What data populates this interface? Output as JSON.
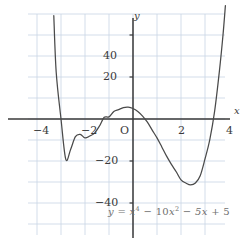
{
  "chart_data": {
    "type": "line",
    "title": "",
    "subtitle": "",
    "equation_text": "y = x⁴ − 10x² − 5x + 5",
    "equation_parts": {
      "lhs": "y",
      "equals": "=",
      "t1_base": "x",
      "t1_exp": "4",
      "op1": "−",
      "t2_coef": "10",
      "t2_base": "x",
      "t2_exp": "2",
      "op2": "−",
      "t3": "5x",
      "op3": "+",
      "t4": "5"
    },
    "function": "x**4 - 10*x**2 - 5*x + 5",
    "xlabel": "x",
    "ylabel": "y",
    "origin_label": "O",
    "xlim": [
      -4.4,
      3.85
    ],
    "ylim": [
      -50,
      55
    ],
    "x_ticks": [
      -4,
      -2,
      2,
      4
    ],
    "x_tick_labels": [
      "−4",
      "−2",
      "2",
      "4"
    ],
    "y_ticks": [
      -40,
      -20,
      20,
      40
    ],
    "y_tick_labels": [
      "−40",
      "−20",
      "20",
      "40"
    ],
    "grid": true,
    "grid_x_step": 1,
    "grid_y_step": 10,
    "legend": "none",
    "roots_approx": [
      -2.96,
      -1.34,
      0.54,
      3.75
    ],
    "local_extrema": [
      {
        "kind": "local-min",
        "x": -2.13,
        "y": -7.9
      },
      {
        "kind": "local-max",
        "x": -0.25,
        "y": 5.6
      },
      {
        "kind": "local-min",
        "x": 2.38,
        "y": -31.4
      }
    ],
    "points": [
      {
        "x": -3.3,
        "y": 49.2
      },
      {
        "x": -3.2,
        "y": 22.3
      },
      {
        "x": -3.0,
        "y": 0.0
      },
      {
        "x": -2.8,
        "y": -19.2
      },
      {
        "x": -2.6,
        "y": -14.5
      },
      {
        "x": -2.4,
        "y": -8.4
      },
      {
        "x": -2.2,
        "y": -7.3
      },
      {
        "x": -2.0,
        "y": -9.0
      },
      {
        "x": -1.8,
        "y": -8.1
      },
      {
        "x": -1.6,
        "y": -6.7
      },
      {
        "x": -1.4,
        "y": -3.4
      },
      {
        "x": -1.2,
        "y": 0.8
      },
      {
        "x": -1.0,
        "y": 1.0
      },
      {
        "x": -0.8,
        "y": 3.6
      },
      {
        "x": -0.6,
        "y": 4.5
      },
      {
        "x": -0.4,
        "y": 5.4
      },
      {
        "x": -0.2,
        "y": 5.6
      },
      {
        "x": 0.0,
        "y": 5.0
      },
      {
        "x": 0.2,
        "y": 3.6
      },
      {
        "x": 0.4,
        "y": 1.4
      },
      {
        "x": 0.6,
        "y": -1.5
      },
      {
        "x": 0.8,
        "y": -5.3
      },
      {
        "x": 1.0,
        "y": -9.0
      },
      {
        "x": 1.2,
        "y": -13.3
      },
      {
        "x": 1.4,
        "y": -17.7
      },
      {
        "x": 1.6,
        "y": -21.6
      },
      {
        "x": 1.8,
        "y": -25.1
      },
      {
        "x": 2.0,
        "y": -29.0
      },
      {
        "x": 2.2,
        "y": -30.5
      },
      {
        "x": 2.4,
        "y": -31.4
      },
      {
        "x": 2.6,
        "y": -30.5
      },
      {
        "x": 2.8,
        "y": -27.0
      },
      {
        "x": 3.0,
        "y": -19.0
      },
      {
        "x": 3.2,
        "y": -9.8
      },
      {
        "x": 3.4,
        "y": 3.6
      },
      {
        "x": 3.6,
        "y": 22.8
      },
      {
        "x": 3.75,
        "y": 40.0
      },
      {
        "x": 3.85,
        "y": 54.0
      }
    ],
    "colors": {
      "curve": "#4a4a4a",
      "axis": "#3a3a3a",
      "grid": "#c8d4e4",
      "tick_text": "#3a3a3a",
      "equation_text": "#6f6f6f",
      "background": "#ffffff"
    }
  }
}
